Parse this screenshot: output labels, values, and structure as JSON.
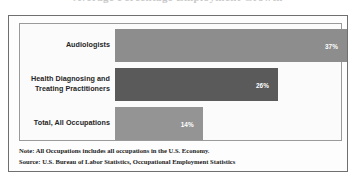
{
  "document": {
    "title_remnant": "Average Percentage Employment Growth",
    "frame_color": "#6f6f6f"
  },
  "chart_data": {
    "type": "bar",
    "orientation": "horizontal",
    "title": "",
    "xlabel": "",
    "ylabel": "",
    "categories": [
      "Audiologists",
      "Health Diagnosing and\nTreating Practitioners",
      "Total, All Occupations"
    ],
    "values": [
      37,
      26,
      14
    ],
    "value_labels": [
      "37%",
      "26%",
      "14%"
    ],
    "xlim": [
      0,
      37
    ],
    "grid": false,
    "legend": null,
    "bar_colors": [
      "#8d8d8d",
      "#5a5a5a",
      "#949494"
    ]
  },
  "bars": [
    {
      "label_line_1": "Audiologists",
      "label_line_2": "",
      "value_label": "37%",
      "value": 37,
      "shade": "shade-light"
    },
    {
      "label_line_1": "Health Diagnosing and",
      "label_line_2": "Treating Practitioners",
      "value_label": "26%",
      "value": 26,
      "shade": "shade-dark"
    },
    {
      "label_line_1": "Total, All Occupations",
      "label_line_2": "",
      "value_label": "14%",
      "value": 14,
      "shade": "shade-mid"
    }
  ],
  "footnotes": {
    "note": "Note: All Occupations includes all occupations in the U.S. Economy.",
    "source": "Source: U.S. Bureau of Labor Statistics, Occupational Employment Statistics"
  }
}
